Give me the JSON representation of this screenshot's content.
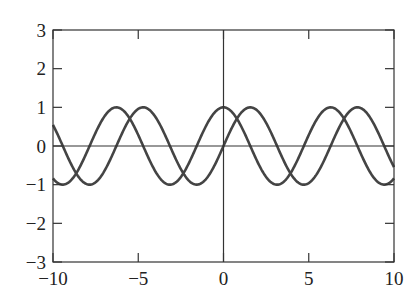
{
  "chart_data": {
    "type": "line",
    "title": "",
    "xlabel": "",
    "ylabel": "",
    "xlim": [
      -10,
      10
    ],
    "ylim": [
      -3,
      3
    ],
    "grid": false,
    "legend": null,
    "xticks": [
      -10,
      -5,
      0,
      5,
      10
    ],
    "yticks": [
      -3,
      -2,
      -1,
      0,
      1,
      2,
      3
    ],
    "xtick_labels": [
      "−10",
      "−5",
      "0",
      "5",
      "10"
    ],
    "ytick_labels": [
      "−3",
      "−2",
      "−1",
      "0",
      "1",
      "2",
      "3"
    ],
    "reference_lines": [
      {
        "orientation": "horizontal",
        "value": 0
      },
      {
        "orientation": "vertical",
        "value": 0
      }
    ],
    "series": [
      {
        "name": "sin(x)",
        "function": "sin",
        "color": "#444444"
      },
      {
        "name": "cos(x)",
        "function": "cos",
        "color": "#444444"
      }
    ]
  },
  "colors": {
    "curve": "#444444",
    "axis": "#333333",
    "background": "#ffffff"
  }
}
